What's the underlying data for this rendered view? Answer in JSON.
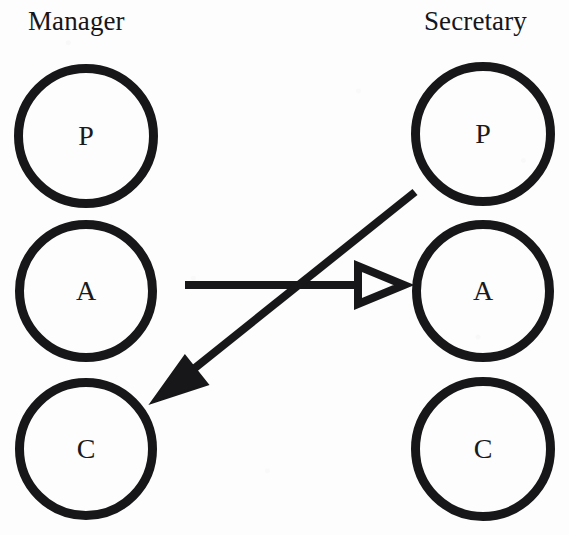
{
  "diagram": {
    "background_color": "#fdfdfd",
    "ink_color": "#171719",
    "columns": [
      {
        "id": "manager",
        "label": "Manager"
      },
      {
        "id": "secretary",
        "label": "Secretary"
      }
    ],
    "nodes": [
      {
        "id": "manager-p",
        "column": "manager",
        "letter": "P",
        "meaning": "Presentation",
        "cx": 86,
        "cy": 136,
        "r": 72
      },
      {
        "id": "manager-a",
        "column": "manager",
        "letter": "A",
        "meaning": "Abstraction",
        "cx": 86,
        "cy": 291,
        "r": 71
      },
      {
        "id": "manager-c",
        "column": "manager",
        "letter": "C",
        "meaning": "Control",
        "cx": 86,
        "cy": 449,
        "r": 71
      },
      {
        "id": "secretary-p",
        "column": "secretary",
        "letter": "P",
        "meaning": "Presentation",
        "cx": 483,
        "cy": 134,
        "r": 72
      },
      {
        "id": "secretary-a",
        "column": "secretary",
        "letter": "A",
        "meaning": "Abstraction",
        "cx": 483,
        "cy": 291,
        "r": 71
      },
      {
        "id": "secretary-c",
        "column": "secretary",
        "letter": "C",
        "meaning": "Control",
        "cx": 483,
        "cy": 449,
        "r": 72
      }
    ],
    "arrows": [
      {
        "id": "manager-a-to-secretary-a",
        "from": "manager-a",
        "to": "secretary-a",
        "head": "hollow-triangle",
        "x1": 185,
        "y1": 285,
        "x2": 404,
        "y2": 285,
        "stroke_width": 8
      },
      {
        "id": "secretary-p-to-manager-c",
        "from": "secretary-p",
        "to": "manager-c",
        "head": "solid-triangle",
        "x1": 415,
        "y1": 192,
        "x2": 151,
        "y2": 403,
        "stroke_width": 8
      }
    ]
  }
}
